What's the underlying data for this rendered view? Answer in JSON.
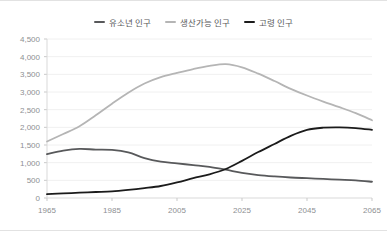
{
  "chart_data": {
    "type": "line",
    "title": "",
    "xlabel": "",
    "ylabel": "",
    "xlim": [
      1965,
      2065
    ],
    "ylim": [
      0,
      4500
    ],
    "ytick_values": [
      0,
      500,
      1000,
      1500,
      2000,
      2500,
      3000,
      3500,
      4000,
      4500
    ],
    "ytick_labels": [
      "0",
      "500",
      "1,000",
      "1,500",
      "2,000",
      "2,500",
      "3,000",
      "3,500",
      "4,000",
      "4,500"
    ],
    "xtick_values": [
      1965,
      1985,
      2005,
      2025,
      2045,
      2065
    ],
    "xtick_labels": [
      "1965",
      "1985",
      "2005",
      "2025",
      "2045",
      "2065"
    ],
    "grid": true,
    "legend_position": "top-center",
    "x": [
      1965,
      1970,
      1975,
      1980,
      1985,
      1990,
      1995,
      2000,
      2005,
      2010,
      2015,
      2020,
      2025,
      2030,
      2035,
      2040,
      2045,
      2050,
      2055,
      2060,
      2065
    ],
    "series": [
      {
        "name": "유소년 인구",
        "color": "#58595b",
        "values": [
          1240,
          1340,
          1390,
          1370,
          1360,
          1290,
          1130,
          1030,
          980,
          930,
          880,
          800,
          710,
          650,
          610,
          580,
          560,
          540,
          520,
          500,
          460
        ]
      },
      {
        "name": "생산가능 인구",
        "color": "#b5b5b5",
        "values": [
          1600,
          1810,
          2030,
          2340,
          2670,
          2980,
          3240,
          3420,
          3540,
          3650,
          3740,
          3790,
          3700,
          3520,
          3310,
          3090,
          2900,
          2730,
          2570,
          2400,
          2200
        ]
      },
      {
        "name": "고령 인구",
        "color": "#1b1b1b",
        "values": [
          110,
          130,
          150,
          170,
          190,
          230,
          280,
          340,
          440,
          560,
          670,
          820,
          1050,
          1300,
          1530,
          1760,
          1930,
          1990,
          2000,
          1980,
          1930
        ]
      }
    ]
  },
  "legend": {
    "items": [
      {
        "label": "유소년 인구",
        "color": "#58595b"
      },
      {
        "label": "생산가능 인구",
        "color": "#b5b5b5"
      },
      {
        "label": "고령 인구",
        "color": "#1b1b1b"
      }
    ]
  }
}
